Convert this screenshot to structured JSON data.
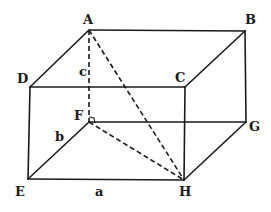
{
  "diagram": {
    "type": "rectangular-box-3d",
    "stroke_color": "#1a1a1a",
    "background": "#ffffff",
    "vertices": {
      "A": {
        "x": 89,
        "y": 30,
        "label": "A",
        "lx": 83,
        "ly": 24
      },
      "B": {
        "x": 245,
        "y": 31,
        "label": "B",
        "lx": 245,
        "ly": 24
      },
      "C": {
        "x": 185,
        "y": 87,
        "label": "C",
        "lx": 175,
        "ly": 82
      },
      "D": {
        "x": 30,
        "y": 87,
        "label": "D",
        "lx": 17,
        "ly": 83
      },
      "E": {
        "x": 28,
        "y": 179,
        "label": "E",
        "lx": 15,
        "ly": 196
      },
      "F": {
        "x": 89,
        "y": 122,
        "label": "F",
        "lx": 74,
        "ly": 120
      },
      "G": {
        "x": 246,
        "y": 122,
        "label": "G",
        "lx": 249,
        "ly": 131
      },
      "H": {
        "x": 184,
        "y": 180,
        "label": "H",
        "lx": 179,
        "ly": 196
      }
    },
    "edge_labels": [
      {
        "text": "a",
        "x": 95,
        "y": 196
      },
      {
        "text": "b",
        "x": 55,
        "y": 141
      },
      {
        "text": "c",
        "x": 79,
        "y": 76
      }
    ],
    "solid_edges": [
      [
        "A",
        "B"
      ],
      [
        "A",
        "D"
      ],
      [
        "B",
        "C"
      ],
      [
        "D",
        "C"
      ],
      [
        "D",
        "E"
      ],
      [
        "C",
        "H"
      ],
      [
        "B",
        "G"
      ],
      [
        "E",
        "H"
      ],
      [
        "H",
        "G"
      ],
      [
        "F",
        "G"
      ],
      [
        "E",
        "F"
      ]
    ],
    "dashed_edges": [
      [
        "A",
        "F"
      ],
      [
        "A",
        "H"
      ],
      [
        "F",
        "H"
      ]
    ],
    "right_angle_at": "F"
  }
}
